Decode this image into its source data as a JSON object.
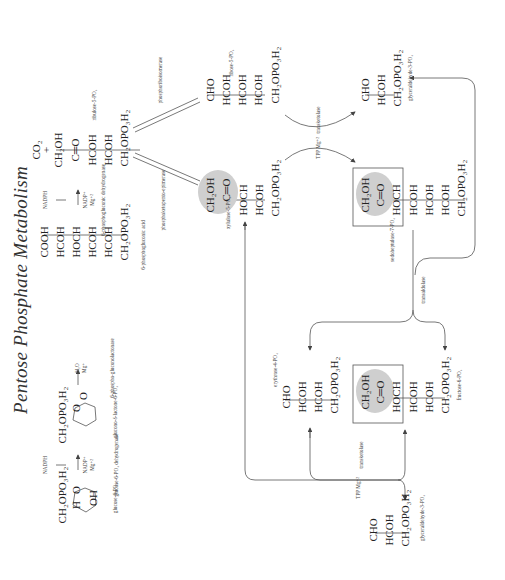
{
  "title": "Pentose Phosphate Metabolism",
  "orientation": "rotated -90deg (text reads bottom-to-top)",
  "compounds": {
    "glucose6p": {
      "rows": [
        "CH₂OPO₃H₂",
        "O",
        "H",
        "OH"
      ],
      "label": "glucose-6-PO₄"
    },
    "gluconolactone": {
      "rows": [
        "CH₂OPO₃H₂",
        "O",
        "O"
      ],
      "label": "glucono-δ-lactone-6-PO₄"
    },
    "phosphogluconate": {
      "rows": [
        "COOH",
        "HCOH",
        "HOCH",
        "HCOH",
        "HCOH",
        "CH₂OPO₃H₂"
      ],
      "label": "6-phosphogluconic acid"
    },
    "ribulose5p": {
      "rows": [
        "CO₂",
        "+",
        "CH₂OH",
        "C═O",
        "HCOH",
        "HCOH",
        "CH₂OPO₃H₂"
      ],
      "label": "ribulose-5-PO₄"
    },
    "ribose5p": {
      "rows": [
        "CHO",
        "HCOH",
        "HCOH",
        "HCOH",
        "CH₂OPO₃H₂"
      ],
      "label": "ribose-5-PO₄"
    },
    "xylulose5p": {
      "rows": [
        "CH₂OH",
        "C═O",
        "HOCH",
        "HCOH",
        "CH₂OPO₃H₂"
      ],
      "label": "xylulose-5-PO₄"
    },
    "glyceraldehyde3p_top": {
      "rows": [
        "CHO",
        "HCOH",
        "CH₂OPO₃H₂"
      ],
      "label": "glyceraldehyde-3-PO₄"
    },
    "sedoheptulose7p": {
      "rows": [
        "CH₂OH",
        "C═O",
        "HOCH",
        "HCOH",
        "HCOH",
        "HCOH",
        "CH₂OPO₃H₂"
      ],
      "label": "sedoheptulose-7-PO₄"
    },
    "erythrose4p": {
      "rows": [
        "CHO",
        "HCOH",
        "HCOH",
        "CH₂OPO₃H₂"
      ],
      "label": "erythrose-4-PO₄"
    },
    "fructose6p": {
      "rows": [
        "CH₂OH",
        "C═O",
        "HOCH",
        "HCOH",
        "HCOH",
        "CH₂OPO₃H₂"
      ],
      "label": "fructose-6-PO₄"
    },
    "glyceraldehyde3p_bottom": {
      "rows": [
        "CHO",
        "HCOH",
        "CH₂OPO₃H₂"
      ],
      "label": "glyceraldehyde-3-PO₄"
    }
  },
  "reactions": {
    "g6pdh": {
      "cofactor_in": "NADP⁺",
      "cofactor_metal": "Mg⁺²",
      "product": "NADPH",
      "enzyme": "glucose-6-PO₄ dehydrogenase"
    },
    "lactonase": {
      "cofactor_in": "H₂O",
      "cofactor_metal": "Mg⁺",
      "enzyme": "6-phospho-gluconolactonase"
    },
    "pgdh": {
      "cofactor_in": "NADP⁺",
      "cofactor_metal": "Mg⁺²",
      "product": "NADPH",
      "enzyme": "6-phosphogluconic dehydrogenase"
    },
    "isomerase": {
      "enzyme": "phosphoriboisomerase"
    },
    "epimerase": {
      "enzyme": "phosphoketopento-epimerase"
    },
    "transketolase1": {
      "cofactors": "TPP Mg⁺²",
      "enzyme": "transketolase"
    },
    "transaldolase": {
      "enzyme": "transaldolase"
    },
    "transketolase2": {
      "cofactors": "TPP Mg⁺²",
      "enzyme": "transketolase"
    }
  }
}
